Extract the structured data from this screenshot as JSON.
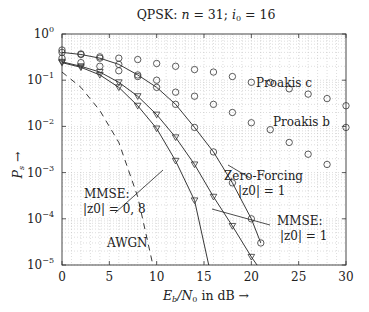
{
  "chart_data": {
    "type": "line",
    "title": "QPSK: n = 31; i0 = 16",
    "xlabel": "Eb/N0 in dB →",
    "ylabel": "Ps →",
    "xlim": [
      0,
      30
    ],
    "ylim": [
      1e-05,
      1
    ],
    "yscale": "log",
    "grid": true,
    "xticks": [
      "0",
      "5",
      "10",
      "15",
      "20",
      "25",
      "30"
    ],
    "yticks": [
      "10^0",
      "10^-1",
      "10^-2",
      "10^-3",
      "10^-4",
      "10^-5"
    ],
    "series": [
      {
        "name": "Zero-Forcing |z0| = 1",
        "marker": "circle",
        "line": "solid",
        "x": [
          0,
          2,
          4,
          6,
          8,
          10,
          12,
          14,
          16,
          18,
          20,
          21
        ],
        "values": [
          0.4,
          0.36,
          0.3,
          0.22,
          0.13,
          0.07,
          0.03,
          0.0095,
          0.0028,
          0.0006,
          0.0001,
          3e-05
        ]
      },
      {
        "name": "MMSE |z0| = 1",
        "marker": "triangle-down",
        "line": "solid",
        "x": [
          0,
          2,
          4,
          6,
          8,
          10,
          12,
          14,
          16,
          18,
          20,
          20.6
        ],
        "values": [
          0.25,
          0.2,
          0.15,
          0.09,
          0.045,
          0.018,
          0.0058,
          0.0015,
          0.0003,
          7e-05,
          1.5e-05,
          1e-05
        ]
      },
      {
        "name": "MMSE |z0| = 0,8",
        "marker": "triangle-down",
        "line": "solid",
        "x": [
          0,
          2,
          4,
          6,
          8,
          10,
          12,
          14,
          15.5
        ],
        "values": [
          0.24,
          0.19,
          0.13,
          0.07,
          0.028,
          0.009,
          0.0018,
          0.00025,
          1e-05
        ]
      },
      {
        "name": "AWGN",
        "marker": "none",
        "line": "dashed",
        "x": [
          0,
          2,
          4,
          6,
          8,
          9.6
        ],
        "values": [
          0.15,
          0.07,
          0.022,
          0.0045,
          0.0003,
          1e-05
        ]
      },
      {
        "name": "Proakis c",
        "marker": "circle",
        "line": "none",
        "x": [
          0,
          2,
          4,
          6,
          8,
          10,
          12,
          14,
          16,
          18,
          20,
          22,
          24,
          26,
          28,
          30
        ],
        "values": [
          0.45,
          0.37,
          0.32,
          0.3,
          0.28,
          0.23,
          0.2,
          0.17,
          0.15,
          0.12,
          0.09,
          0.09,
          0.065,
          0.05,
          0.04,
          0.028
        ]
      },
      {
        "name": "Proakis b",
        "marker": "circle",
        "line": "none",
        "x": [
          0,
          2,
          4,
          6,
          8,
          10,
          12,
          14,
          16,
          18,
          20,
          22,
          24,
          26,
          28,
          30
        ],
        "values": [
          0.3,
          0.24,
          0.2,
          0.16,
          0.12,
          0.1,
          0.055,
          0.045,
          0.03,
          0.02,
          0.012,
          0.0085,
          0.0045,
          0.0025,
          0.0015,
          0.0095
        ]
      }
    ],
    "annotations": [
      {
        "text": "Proakis c",
        "x": 21,
        "y": 0.13
      },
      {
        "text": "Proakis b",
        "x": 23,
        "y": 0.012
      },
      {
        "text": "Zero-Forcing",
        "x": 19,
        "y": 0.0012
      },
      {
        "text": "|z0| = 1",
        "x": 20.2,
        "y": 0.0006
      },
      {
        "text": "MMSE:",
        "x": 24.5,
        "y": 0.00012
      },
      {
        "text": "|z0| = 1",
        "x": 24.5,
        "y": 6e-05
      },
      {
        "text": "MMSE:",
        "x": 2.7,
        "y": 0.00045
      },
      {
        "text": "|z0| = 0, 8",
        "x": 2.7,
        "y": 0.00022
      },
      {
        "text": "AWGN",
        "x": 5.2,
        "y": 3.5e-05
      }
    ]
  },
  "labels": {
    "title_prefix": "QPSK: ",
    "title_n": "n",
    "title_eq1": " = 31; ",
    "title_i": "i",
    "title_sub": "0",
    "title_eq2": " = 16",
    "ylabel_main": "P",
    "ylabel_sub": "s",
    "ylabel_arrow": "→",
    "xlabel_e": "E",
    "xlabel_esub": "b",
    "xlabel_n": "/N",
    "xlabel_nsub": "0",
    "xlabel_rest": " in dB →",
    "proakis_c": "Proakis c",
    "proakis_b": "Proakis b",
    "zf_1": "Zero-Forcing",
    "zf_2": "|z0| = 1",
    "mmse1_1": "MMSE:",
    "mmse1_2": "|z0| = 1",
    "mmse08_1": "MMSE:",
    "mmse08_2": "|z0| = 0, 8",
    "awgn": "AWGN"
  }
}
